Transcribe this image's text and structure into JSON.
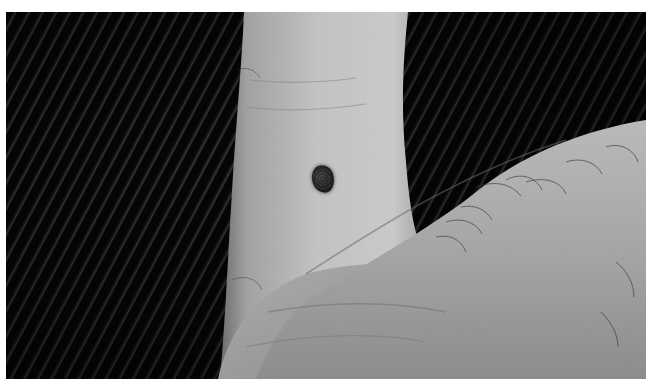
{
  "image": {
    "kind": "photograph",
    "color_mode": "grayscale",
    "subject": "pigmented mole on the side of a finger",
    "background": "dark corduroy fabric",
    "secondary_subject": "thumb crossing lower right with fine hairs"
  },
  "colors": {
    "border": "#ffffff",
    "fabric_dark": "#060606",
    "fabric_rib": "#3a3a3a",
    "skin_light": "#c9c9c9",
    "skin_mid": "#a8a8a8",
    "skin_shadow": "#7a7a7a",
    "mole": "#232323"
  }
}
